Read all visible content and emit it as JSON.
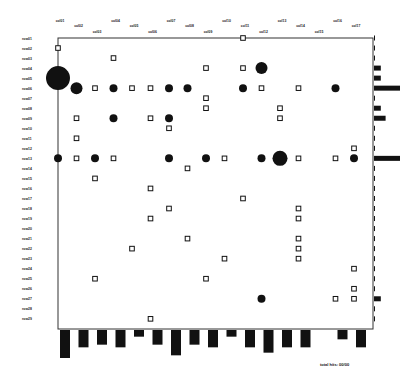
{
  "chart_data": {
    "type": "scatter",
    "subtype": "dot-matrix with marginal bar histograms",
    "title": "",
    "xlabel": "",
    "ylabel": "",
    "column_labels": [
      "col01",
      "col02",
      "col03",
      "col04",
      "col05",
      "col06",
      "col07",
      "col08",
      "col09",
      "col10",
      "col11",
      "col12",
      "col13",
      "col14",
      "col15",
      "col16",
      "col17"
    ],
    "row_labels": [
      "row01",
      "row02",
      "row03",
      "row04",
      "row05",
      "row06",
      "row07",
      "row08",
      "row09",
      "row10",
      "row11",
      "row12",
      "row13",
      "row14",
      "row15",
      "row16",
      "row17",
      "row18",
      "row19",
      "row20",
      "row21",
      "row22",
      "row23",
      "row24",
      "row25",
      "row26",
      "row27",
      "row28",
      "row29"
    ],
    "marker_legend": {
      "filled-circle": "hit (size = count)",
      "open-square": "single/low hit"
    },
    "points": [
      {
        "col": 10,
        "row": 0,
        "marker": "square"
      },
      {
        "col": 0,
        "row": 1,
        "marker": "square"
      },
      {
        "col": 3,
        "row": 2,
        "marker": "square"
      },
      {
        "col": 8,
        "row": 3,
        "marker": "square"
      },
      {
        "col": 10,
        "row": 3,
        "marker": "square"
      },
      {
        "col": 11,
        "row": 3,
        "marker": "circle",
        "size": 3
      },
      {
        "col": 0,
        "row": 4,
        "marker": "circle",
        "size": 6
      },
      {
        "col": 1,
        "row": 5,
        "marker": "circle",
        "size": 3
      },
      {
        "col": 2,
        "row": 5,
        "marker": "square"
      },
      {
        "col": 3,
        "row": 5,
        "marker": "circle",
        "size": 2
      },
      {
        "col": 4,
        "row": 5,
        "marker": "square"
      },
      {
        "col": 5,
        "row": 5,
        "marker": "square"
      },
      {
        "col": 6,
        "row": 5,
        "marker": "circle",
        "size": 2
      },
      {
        "col": 7,
        "row": 5,
        "marker": "circle",
        "size": 2
      },
      {
        "col": 10,
        "row": 5,
        "marker": "circle",
        "size": 2
      },
      {
        "col": 11,
        "row": 5,
        "marker": "square"
      },
      {
        "col": 13,
        "row": 5,
        "marker": "square"
      },
      {
        "col": 15,
        "row": 5,
        "marker": "circle",
        "size": 2
      },
      {
        "col": 8,
        "row": 6,
        "marker": "square"
      },
      {
        "col": 8,
        "row": 7,
        "marker": "square"
      },
      {
        "col": 12,
        "row": 7,
        "marker": "square"
      },
      {
        "col": 1,
        "row": 8,
        "marker": "square"
      },
      {
        "col": 3,
        "row": 8,
        "marker": "circle",
        "size": 2
      },
      {
        "col": 5,
        "row": 8,
        "marker": "square"
      },
      {
        "col": 6,
        "row": 8,
        "marker": "circle",
        "size": 2
      },
      {
        "col": 12,
        "row": 8,
        "marker": "square"
      },
      {
        "col": 6,
        "row": 9,
        "marker": "square"
      },
      {
        "col": 1,
        "row": 10,
        "marker": "square"
      },
      {
        "col": 16,
        "row": 11,
        "marker": "square"
      },
      {
        "col": 0,
        "row": 12,
        "marker": "circle",
        "size": 2
      },
      {
        "col": 1,
        "row": 12,
        "marker": "square"
      },
      {
        "col": 2,
        "row": 12,
        "marker": "circle",
        "size": 2
      },
      {
        "col": 3,
        "row": 12,
        "marker": "square"
      },
      {
        "col": 6,
        "row": 12,
        "marker": "circle",
        "size": 2
      },
      {
        "col": 8,
        "row": 12,
        "marker": "circle",
        "size": 2
      },
      {
        "col": 9,
        "row": 12,
        "marker": "square"
      },
      {
        "col": 11,
        "row": 12,
        "marker": "circle",
        "size": 2
      },
      {
        "col": 12,
        "row": 12,
        "marker": "circle",
        "size": 4
      },
      {
        "col": 13,
        "row": 12,
        "marker": "square"
      },
      {
        "col": 15,
        "row": 12,
        "marker": "square"
      },
      {
        "col": 16,
        "row": 12,
        "marker": "circle",
        "size": 2
      },
      {
        "col": 7,
        "row": 13,
        "marker": "square"
      },
      {
        "col": 2,
        "row": 14,
        "marker": "square"
      },
      {
        "col": 5,
        "row": 15,
        "marker": "square"
      },
      {
        "col": 10,
        "row": 16,
        "marker": "square"
      },
      {
        "col": 6,
        "row": 17,
        "marker": "square"
      },
      {
        "col": 13,
        "row": 17,
        "marker": "square"
      },
      {
        "col": 5,
        "row": 18,
        "marker": "square"
      },
      {
        "col": 13,
        "row": 18,
        "marker": "square"
      },
      {
        "col": 7,
        "row": 20,
        "marker": "square"
      },
      {
        "col": 13,
        "row": 20,
        "marker": "square"
      },
      {
        "col": 4,
        "row": 21,
        "marker": "square"
      },
      {
        "col": 13,
        "row": 21,
        "marker": "square"
      },
      {
        "col": 9,
        "row": 22,
        "marker": "square"
      },
      {
        "col": 13,
        "row": 22,
        "marker": "square"
      },
      {
        "col": 16,
        "row": 23,
        "marker": "square"
      },
      {
        "col": 2,
        "row": 24,
        "marker": "square"
      },
      {
        "col": 8,
        "row": 24,
        "marker": "square"
      },
      {
        "col": 16,
        "row": 25,
        "marker": "square"
      },
      {
        "col": 11,
        "row": 26,
        "marker": "circle",
        "size": 2
      },
      {
        "col": 15,
        "row": 26,
        "marker": "square"
      },
      {
        "col": 16,
        "row": 26,
        "marker": "square"
      },
      {
        "col": 5,
        "row": 28,
        "marker": "square"
      }
    ],
    "column_totals": [
      9,
      5,
      4,
      5,
      1,
      4,
      8,
      4,
      5,
      1,
      5,
      7,
      5,
      5,
      0,
      2,
      5
    ],
    "row_totals": [
      0,
      0,
      0,
      1,
      1,
      5,
      0,
      1,
      2,
      0,
      0,
      0,
      5,
      0,
      0,
      0,
      0,
      0,
      0,
      0,
      0,
      0,
      0,
      0,
      0,
      0,
      1,
      0,
      0
    ],
    "footer": "total hits: 00/00",
    "grid": false,
    "legend": "none"
  },
  "colors": {
    "ink": "#111111",
    "frame": "#333333",
    "background": "#ffffff"
  }
}
